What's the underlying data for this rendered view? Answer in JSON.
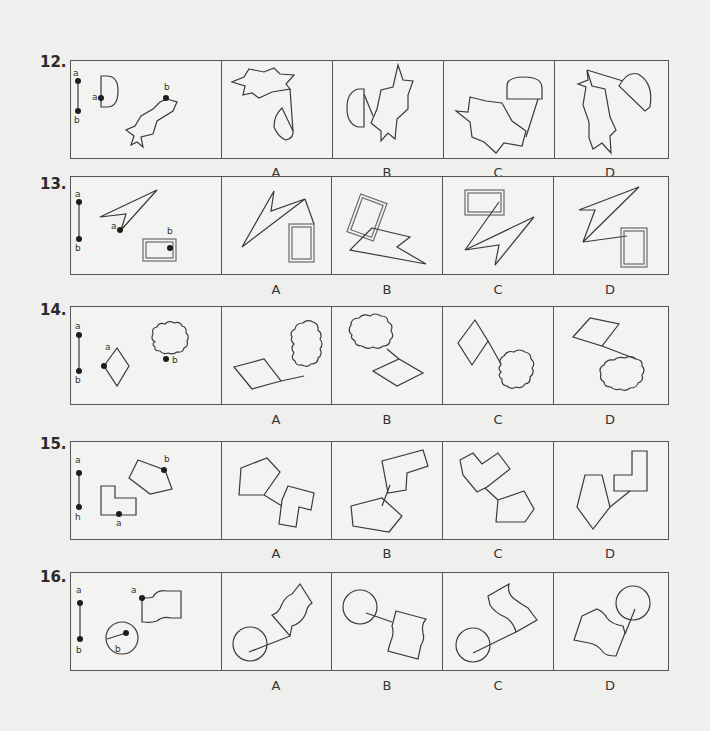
{
  "problems": [
    {
      "number": "12.",
      "reference": {
        "segment_labels": [
          "a",
          "b"
        ],
        "shape1": "half-disc (D shape)",
        "shape1_point": "a",
        "shape2": "eight-pointed irregular star",
        "shape2_point": "b"
      },
      "options": [
        {
          "label": "A",
          "description": "star above, half-disc lower right, joined by a line"
        },
        {
          "label": "B",
          "description": "half-disc left, star right, joined"
        },
        {
          "label": "C",
          "description": "half-disc top right, star lower left, joined by a line"
        },
        {
          "label": "D",
          "description": "star left, half-disc upper right, joined by a line"
        }
      ]
    },
    {
      "number": "13.",
      "reference": {
        "segment_labels": [
          "a",
          "b"
        ],
        "shape1": "arrowhead / lightning shape",
        "shape1_point": "a",
        "shape2": "double-lined rectangle",
        "shape2_point": "b"
      },
      "options": [
        {
          "label": "A",
          "description": "zigzag top left joined to a double rectangle at lower right"
        },
        {
          "label": "B",
          "description": "tilted double rectangle top left, zigzag below"
        },
        {
          "label": "C",
          "description": "double rectangle top left, zigzag below it"
        },
        {
          "label": "D",
          "description": "zigzag top, double rectangle lower right"
        }
      ]
    },
    {
      "number": "14.",
      "reference": {
        "segment_labels": [
          "a",
          "b"
        ],
        "shape1": "rhombus",
        "shape1_point": "a",
        "shape2": "cloud",
        "shape2_point": "b"
      },
      "options": [
        {
          "label": "A",
          "description": "rhombus lower left, cloud upper right"
        },
        {
          "label": "B",
          "description": "cloud top left, rhombus lower right"
        },
        {
          "label": "C",
          "description": "rhombus upper left, cloud lower right"
        },
        {
          "label": "D",
          "description": "rhombus top, cloud lower right"
        }
      ]
    },
    {
      "number": "15.",
      "reference": {
        "segment_labels": [
          "a",
          "h"
        ],
        "shape1": "L-shape",
        "shape1_point": "a",
        "shape2": "pentagon",
        "shape2_point": "b"
      },
      "options": [
        {
          "label": "A",
          "description": "pentagon upper left, L-shape lower right"
        },
        {
          "label": "B",
          "description": "L-shape top, pentagon lower left"
        },
        {
          "label": "C",
          "description": "L-shape top left, pentagon lower right"
        },
        {
          "label": "D",
          "description": "pentagon left, L-shape upper right"
        }
      ]
    },
    {
      "number": "16.",
      "reference": {
        "segment_labels": [
          "a",
          "b"
        ],
        "shape1": "wavy flag",
        "shape1_point": "a",
        "shape2": "circle with radius",
        "shape2_point": "b"
      },
      "options": [
        {
          "label": "A",
          "description": "circle lower left, flag upper right"
        },
        {
          "label": "B",
          "description": "circle upper left, flag lower right"
        },
        {
          "label": "C",
          "description": "circle lower left, flag upper right"
        },
        {
          "label": "D",
          "description": "flag lower left, circle upper right"
        }
      ]
    }
  ],
  "colors": {
    "background": "#efefed",
    "line": "#3a3a3a",
    "border": "#555555"
  }
}
